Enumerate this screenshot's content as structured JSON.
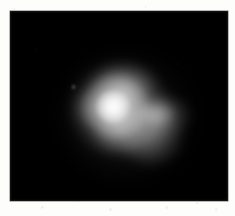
{
  "figure": {
    "kind": "astronomical-grayscale-image",
    "caption": "",
    "page_background": "#fdfdfc",
    "sky_background": "#000000",
    "colormap": "grayscale",
    "frame": {
      "x": 10,
      "y": 11,
      "width": 218,
      "height": 190
    }
  },
  "chart_data": {
    "type": "heatmap",
    "title": "",
    "subtitle": "",
    "xlabel": "",
    "ylabel": "",
    "colormap": "grayscale",
    "grid": false,
    "legend": "none",
    "xlim": [
      0,
      218
    ],
    "ylim": [
      0,
      190
    ],
    "value_range": [
      0,
      255
    ],
    "background_value": 0,
    "peak_value": 248,
    "features": [
      {
        "name": "core-peak",
        "x": 113,
        "y": 108,
        "radius": 17,
        "peak_value": 248,
        "label": "bright compact core"
      },
      {
        "name": "core-halo",
        "x": 115,
        "y": 106,
        "radius": 33,
        "peak_value": 214,
        "label": "inner halo"
      },
      {
        "name": "main-envelope",
        "x": 120,
        "y": 109,
        "radius": 48,
        "peak_value": 150,
        "label": "diffuse envelope"
      },
      {
        "name": "north-shoulder",
        "x": 124,
        "y": 85,
        "radius": 32,
        "peak_value": 166,
        "label": "northern shoulder"
      },
      {
        "name": "east-lobe",
        "x": 159,
        "y": 116,
        "radius": 31,
        "peak_value": 150,
        "label": "eastern lobe"
      },
      {
        "name": "east-ridge",
        "x": 157,
        "y": 114,
        "radius": 19,
        "peak_value": 172,
        "label": "eastern ridge"
      },
      {
        "name": "southeast-lobe",
        "x": 153,
        "y": 141,
        "radius": 31,
        "peak_value": 146,
        "label": "south-eastern tail"
      },
      {
        "name": "south-foot",
        "x": 121,
        "y": 134,
        "radius": 27,
        "peak_value": 152,
        "label": "southern foot"
      },
      {
        "name": "west-extension",
        "x": 93,
        "y": 109,
        "radius": 21,
        "peak_value": 128,
        "label": "western extension"
      },
      {
        "name": "outer-glow",
        "x": 129,
        "y": 116,
        "radius": 71,
        "peak_value": 70,
        "label": "faint outer glow"
      },
      {
        "name": "companion-source",
        "x": 74,
        "y": 87,
        "radius": 3,
        "peak_value": 120,
        "label": "faint companion point source"
      }
    ]
  }
}
